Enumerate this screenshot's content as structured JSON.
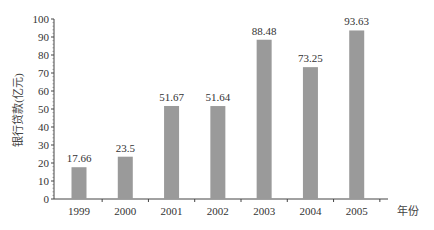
{
  "chart_data": {
    "type": "bar",
    "title": "",
    "xlabel": "年份",
    "ylabel": "银行贷款(亿元)",
    "categories": [
      "1999",
      "2000",
      "2001",
      "2002",
      "2003",
      "2004",
      "2005"
    ],
    "values": [
      17.66,
      23.5,
      51.67,
      51.64,
      88.48,
      73.25,
      93.63
    ],
    "value_labels": [
      "17.66",
      "23.5",
      "51.67",
      "51.64",
      "88.48",
      "73.25",
      "93.63"
    ],
    "ylim": [
      0,
      100
    ],
    "yticks": [
      0,
      10,
      20,
      30,
      40,
      50,
      60,
      70,
      80,
      90,
      100
    ],
    "grid": false,
    "legend": null,
    "bar_color": "#9a9a9a"
  }
}
